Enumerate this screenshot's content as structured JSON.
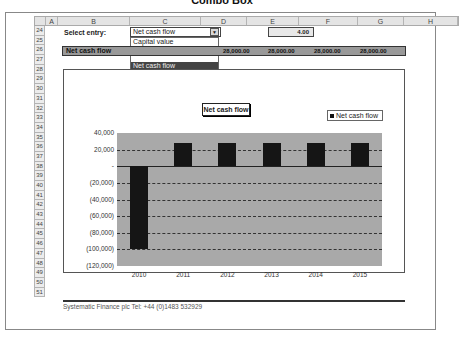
{
  "page_title": "Combo Box",
  "columns": [
    {
      "label": "",
      "w": 11
    },
    {
      "label": "A",
      "w": 12
    },
    {
      "label": "B",
      "w": 72
    },
    {
      "label": "C",
      "w": 71
    },
    {
      "label": "D",
      "w": 46
    },
    {
      "label": "E",
      "w": 52
    },
    {
      "label": "F",
      "w": 59
    },
    {
      "label": "G",
      "w": 46
    },
    {
      "label": "H",
      "w": 54
    }
  ],
  "rows": [
    "24",
    "25",
    "26",
    "27",
    "28",
    "29",
    "30",
    "31",
    "32",
    "33",
    "34",
    "35",
    "36",
    "37",
    "38",
    "39",
    "40",
    "41",
    "42",
    "43",
    "44",
    "45",
    "46",
    "47",
    "48",
    "49",
    "50",
    "51"
  ],
  "select_label": "Select entry:",
  "combo": {
    "value": "Net cash flow",
    "arrow": "▼",
    "options": [
      "Capital value",
      "Periodic cash flow",
      "",
      "Net cash flow",
      "",
      "Cumulative total"
    ],
    "selected_index": 3
  },
  "index_value": "4.00",
  "band": {
    "label": "Net cash flow",
    "values": [
      "28,000.00",
      "28,000.00",
      "28,000.00",
      "28,000.00"
    ]
  },
  "chart_title": "Net cash flow",
  "legend": "Net cash flow",
  "footer": "Systematic Finance plc   Tel: +44 (0)1483 532929",
  "chart_data": {
    "type": "bar",
    "title": "Net cash flow",
    "categories": [
      "2010",
      "2011",
      "2012",
      "2013",
      "2014",
      "2015"
    ],
    "series": [
      {
        "name": "Net cash flow",
        "values": [
          -100000,
          28000,
          28000,
          28000,
          28000,
          28000
        ]
      }
    ],
    "ylim": [
      -120000,
      40000
    ],
    "yticks": [
      "40,000",
      "20,000",
      "-",
      "(20,000)",
      "(40,000)",
      "(60,000)",
      "(80,000)",
      "(100,000)",
      "(120,000)"
    ],
    "grid": true,
    "legend_position": "top-right"
  }
}
